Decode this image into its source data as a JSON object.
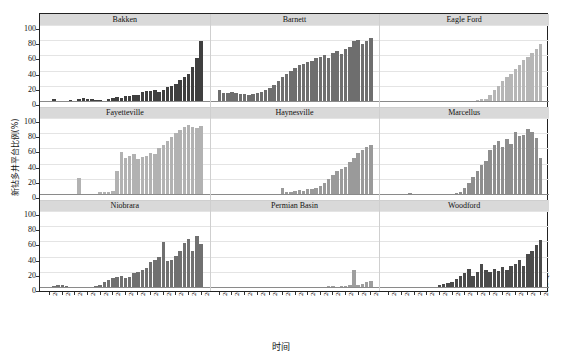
{
  "chart_data": {
    "type": "bar",
    "title": "",
    "xlabel": "时间",
    "ylabel": "新钻多井平台比例(%)",
    "ylim": [
      0,
      100
    ],
    "yticks": [
      0,
      20,
      40,
      60,
      80,
      100
    ],
    "grid": true,
    "legend": null,
    "layout": {
      "rows": 3,
      "cols": 3,
      "facet_titles_on_top": true
    },
    "x": [
      "2004 Q1",
      "2004 Q2",
      "2004 Q3",
      "2004 Q4",
      "2005 Q1",
      "2005 Q2",
      "2005 Q3",
      "2005 Q4",
      "2006 Q1",
      "2006 Q2",
      "2006 Q3",
      "2006 Q4",
      "2007 Q1",
      "2007 Q2",
      "2007 Q3",
      "2007 Q4",
      "2008 Q1",
      "2008 Q2",
      "2008 Q3",
      "2008 Q4",
      "2009 Q1",
      "2009 Q2",
      "2009 Q3",
      "2009 Q4",
      "2010 Q1",
      "2010 Q2",
      "2010 Q3",
      "2010 Q4",
      "2011 Q1",
      "2011 Q2",
      "2011 Q3",
      "2011 Q4",
      "2012 Q1",
      "2012 Q2",
      "2012 Q3",
      "2012 Q4",
      "2013 Q1"
    ],
    "xtick_labels": [
      "2004 Q1",
      "2004 Q4",
      "2005 Q3",
      "2006 Q2",
      "2007 Q1",
      "2007 Q4",
      "2008 Q3",
      "2009 Q2",
      "2010 Q1",
      "2010 Q4",
      "2011 Q3",
      "2012 Q2",
      "2013 Q1"
    ],
    "xtick_indices": [
      0,
      3,
      6,
      9,
      12,
      15,
      18,
      21,
      24,
      27,
      30,
      33,
      36
    ],
    "panels": [
      {
        "name": "Bakken",
        "color": "#3f3f3f",
        "values": [
          0,
          3,
          0,
          0,
          0,
          1,
          0,
          3,
          4,
          2,
          2,
          1,
          1,
          0,
          2,
          4,
          5,
          4,
          6,
          7,
          8,
          8,
          12,
          13,
          13,
          14,
          12,
          15,
          18,
          20,
          23,
          27,
          31,
          36,
          45,
          57,
          79
        ]
      },
      {
        "name": "Barnett",
        "color": "#6e6e6e",
        "values": [
          14,
          10,
          11,
          12,
          11,
          9,
          9,
          8,
          9,
          10,
          12,
          14,
          17,
          21,
          26,
          31,
          36,
          40,
          44,
          47,
          49,
          51,
          53,
          56,
          58,
          61,
          56,
          63,
          66,
          62,
          68,
          71,
          79,
          80,
          75,
          79,
          83
        ]
      },
      {
        "name": "Eagle Ford",
        "color": "#b6b6b6",
        "values": [
          0,
          0,
          0,
          0,
          0,
          0,
          0,
          0,
          0,
          0,
          0,
          0,
          0,
          0,
          0,
          0,
          0,
          0,
          0,
          0,
          0,
          1,
          2,
          3,
          8,
          14,
          20,
          26,
          31,
          36,
          42,
          48,
          54,
          58,
          63,
          68,
          75
        ]
      },
      {
        "name": "Fayetteville",
        "color": "#b2b2b2",
        "values": [
          0,
          0,
          0,
          0,
          0,
          0,
          0,
          21,
          0,
          0,
          0,
          0,
          2,
          3,
          3,
          4,
          30,
          55,
          48,
          50,
          52,
          46,
          49,
          50,
          54,
          52,
          60,
          65,
          70,
          75,
          80,
          84,
          88,
          91,
          88,
          87,
          90
        ]
      },
      {
        "name": "Haynesville",
        "color": "#9a9a9a",
        "values": [
          0,
          0,
          0,
          0,
          0,
          0,
          0,
          0,
          0,
          0,
          0,
          0,
          0,
          0,
          0,
          8,
          2,
          3,
          4,
          5,
          4,
          6,
          7,
          8,
          10,
          14,
          20,
          25,
          30,
          33,
          36,
          42,
          48,
          54,
          58,
          62,
          64
        ]
      },
      {
        "name": "Marcellus",
        "color": "#8e8e8e",
        "values": [
          0,
          0,
          0,
          0,
          0,
          1,
          0,
          0,
          0,
          0,
          0,
          0,
          0,
          0,
          0,
          0,
          1,
          2,
          8,
          14,
          22,
          30,
          38,
          44,
          58,
          64,
          70,
          62,
          73,
          66,
          82,
          76,
          78,
          86,
          82,
          74,
          48
        ]
      },
      {
        "name": "Niobrara",
        "color": "#707070",
        "values": [
          0,
          1,
          2,
          2,
          1,
          0,
          0,
          0,
          0,
          0,
          0,
          1,
          3,
          6,
          9,
          12,
          13,
          14,
          12,
          13,
          19,
          20,
          23,
          25,
          33,
          36,
          40,
          59,
          34,
          35,
          41,
          48,
          58,
          63,
          48,
          67,
          57
        ]
      },
      {
        "name": "Permian Basin",
        "color": "#9e9e9e",
        "values": [
          0,
          0,
          0,
          0,
          0,
          0,
          0,
          0,
          0,
          0,
          0,
          0,
          0,
          0,
          0,
          0,
          0,
          0,
          0,
          0,
          0,
          0,
          0,
          0,
          0,
          0,
          1,
          1,
          0,
          1,
          1,
          2,
          22,
          3,
          4,
          6,
          8
        ]
      },
      {
        "name": "Woodford",
        "color": "#4a4a4a",
        "values": [
          0,
          0,
          0,
          0,
          0,
          0,
          0,
          0,
          0,
          0,
          0,
          0,
          2,
          4,
          5,
          7,
          11,
          14,
          19,
          24,
          15,
          20,
          30,
          22,
          20,
          24,
          21,
          26,
          23,
          28,
          30,
          36,
          27,
          43,
          48,
          55,
          62
        ]
      }
    ]
  },
  "axes": {
    "y_tick_labels": [
      "100",
      "80",
      "60",
      "40",
      "20",
      "0"
    ],
    "x_axis_title": "时间",
    "y_axis_title": "新钻多井平台比例(%)"
  }
}
